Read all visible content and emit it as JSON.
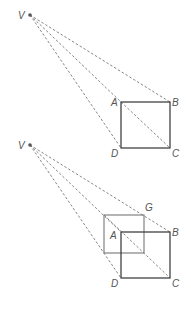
{
  "top": {
    "labels": {
      "V": "V",
      "A": "A",
      "B": "B",
      "C": "C",
      "D": "D"
    }
  },
  "bottom": {
    "labels": {
      "V": "V",
      "A": "A",
      "B": "B",
      "C": "C",
      "D": "D",
      "G": "G"
    }
  }
}
